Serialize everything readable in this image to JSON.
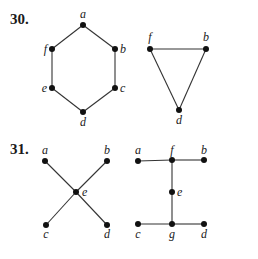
{
  "problems": [
    {
      "number": "30.",
      "graphs": [
        {
          "name": "hexagon",
          "vertices": [
            {
              "id": "a",
              "x": 83,
              "y": 25,
              "lx": 83,
              "ly": 18,
              "anchor": "middle"
            },
            {
              "id": "b",
              "x": 115,
              "y": 49,
              "lx": 120,
              "ly": 53,
              "anchor": "start"
            },
            {
              "id": "c",
              "x": 115,
              "y": 88,
              "lx": 120,
              "ly": 92,
              "anchor": "start"
            },
            {
              "id": "d",
              "x": 83,
              "y": 112,
              "lx": 83,
              "ly": 126,
              "anchor": "middle"
            },
            {
              "id": "e",
              "x": 52,
              "y": 88,
              "lx": 47,
              "ly": 92,
              "anchor": "end"
            },
            {
              "id": "f",
              "x": 52,
              "y": 49,
              "lx": 47,
              "ly": 53,
              "anchor": "end"
            }
          ],
          "edges": [
            [
              "a",
              "b"
            ],
            [
              "b",
              "c"
            ],
            [
              "c",
              "d"
            ],
            [
              "d",
              "e"
            ],
            [
              "e",
              "f"
            ],
            [
              "f",
              "a"
            ]
          ]
        },
        {
          "name": "triangle",
          "vertices": [
            {
              "id": "f",
              "x": 150,
              "y": 49,
              "lx": 150,
              "ly": 41,
              "anchor": "middle"
            },
            {
              "id": "b",
              "x": 206,
              "y": 49,
              "lx": 206,
              "ly": 41,
              "anchor": "middle"
            },
            {
              "id": "d",
              "x": 179,
              "y": 110,
              "lx": 179,
              "ly": 124,
              "anchor": "middle"
            }
          ],
          "edges": [
            [
              "f",
              "b"
            ],
            [
              "b",
              "d"
            ],
            [
              "d",
              "f"
            ]
          ]
        }
      ]
    },
    {
      "number": "31.",
      "graphs": [
        {
          "name": "x-shape",
          "vertices": [
            {
              "id": "a",
              "x": 45,
              "y": 161,
              "lx": 45,
              "ly": 154,
              "anchor": "middle"
            },
            {
              "id": "b",
              "x": 107,
              "y": 161,
              "lx": 107,
              "ly": 154,
              "anchor": "middle"
            },
            {
              "id": "e",
              "x": 76,
              "y": 192,
              "lx": 82,
              "ly": 196,
              "anchor": "start"
            },
            {
              "id": "c",
              "x": 46,
              "y": 225,
              "lx": 46,
              "ly": 238,
              "anchor": "middle"
            },
            {
              "id": "d",
              "x": 107,
              "y": 225,
              "lx": 107,
              "ly": 238,
              "anchor": "middle"
            }
          ],
          "edges": [
            [
              "a",
              "e"
            ],
            [
              "e",
              "d"
            ],
            [
              "b",
              "e"
            ],
            [
              "e",
              "c"
            ]
          ]
        },
        {
          "name": "i-shape",
          "vertices": [
            {
              "id": "a",
              "x": 138,
              "y": 161,
              "lx": 138,
              "ly": 154,
              "anchor": "middle"
            },
            {
              "id": "f",
              "x": 172,
              "y": 160,
              "lx": 172,
              "ly": 154,
              "anchor": "middle"
            },
            {
              "id": "b",
              "x": 204,
              "y": 160,
              "lx": 204,
              "ly": 154,
              "anchor": "middle"
            },
            {
              "id": "e",
              "x": 172,
              "y": 192,
              "lx": 177,
              "ly": 196,
              "anchor": "start"
            },
            {
              "id": "c",
              "x": 138,
              "y": 224,
              "lx": 138,
              "ly": 238,
              "anchor": "middle"
            },
            {
              "id": "g",
              "x": 172,
              "y": 224,
              "lx": 172,
              "ly": 238,
              "anchor": "middle"
            },
            {
              "id": "d",
              "x": 204,
              "y": 224,
              "lx": 204,
              "ly": 238,
              "anchor": "middle"
            }
          ],
          "edges": [
            [
              "a",
              "f"
            ],
            [
              "f",
              "b"
            ],
            [
              "f",
              "e"
            ],
            [
              "e",
              "g"
            ],
            [
              "c",
              "g"
            ],
            [
              "g",
              "d"
            ]
          ]
        }
      ]
    }
  ],
  "labels": {
    "p30": "30.",
    "p31": "31."
  }
}
